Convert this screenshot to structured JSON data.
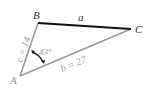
{
  "diagram": {
    "type": "triangle",
    "vertices": {
      "A": {
        "label": "A"
      },
      "B": {
        "label": "B"
      },
      "C": {
        "label": "C"
      }
    },
    "sides": {
      "a": {
        "label": "a",
        "color": "#111111"
      },
      "b": {
        "label": "b = 27",
        "color": "#9a9a9a"
      },
      "c": {
        "label": "c = 14",
        "color": "#9a9a9a"
      }
    },
    "angle_A": {
      "label": "43°"
    }
  }
}
